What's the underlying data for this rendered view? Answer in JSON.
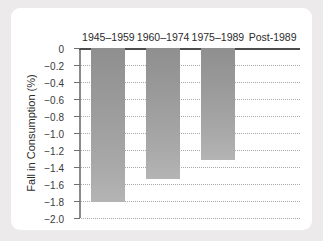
{
  "chart_data": {
    "type": "bar",
    "title": "",
    "xlabel": "",
    "ylabel": "Fall in Consumption (%)",
    "categories": [
      "1945–1959",
      "1960–1974",
      "1975–1989",
      "Post-1989"
    ],
    "values": [
      -1.81,
      -1.54,
      -1.32,
      null
    ],
    "ylim": [
      -2.0,
      0
    ],
    "yticks": [
      0,
      -0.2,
      -0.4,
      -0.6,
      -0.8,
      -1.0,
      -1.2,
      -1.4,
      -1.6,
      -1.8,
      -2.0
    ],
    "ytick_labels": [
      "0",
      "−0.2",
      "−0.4",
      "−0.6",
      "−0.8",
      "−1.0",
      "−1.2",
      "−1.4",
      "−1.6",
      "−1.8",
      "−2.0"
    ],
    "grid": true,
    "legend": null,
    "bar_color": "#9a9a9a",
    "axis_color": "#4c4c4c",
    "grid_color": "#a8a8a8",
    "background": "#ffffff",
    "page_background": "#eceaea",
    "category_labels_position": "top"
  }
}
